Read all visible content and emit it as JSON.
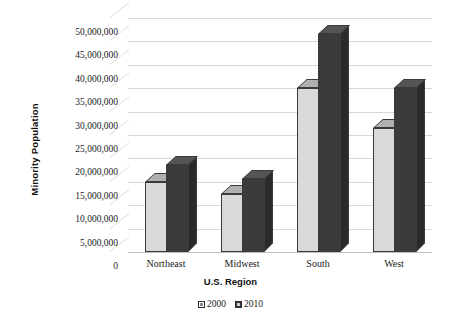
{
  "chart_data": {
    "type": "bar",
    "title": "",
    "xlabel": "U.S. Region",
    "ylabel": "Minority Population",
    "categories": [
      "Northeast",
      "Midwest",
      "South",
      "West"
    ],
    "series": [
      {
        "name": "2000",
        "values": [
          15000000,
          12500000,
          35000000,
          26500000
        ]
      },
      {
        "name": "2010",
        "values": [
          18500000,
          15500000,
          46500000,
          35000000
        ]
      }
    ],
    "ylim": [
      0,
      50000000
    ],
    "ytick_step": 5000000,
    "ytick_labels": [
      "50,000,000",
      "45,000,000",
      "40,000,000",
      "35,000,000",
      "30,000,000",
      "25,000,000",
      "20,000,000",
      "15,000,000",
      "10,000,000",
      "5,000,000",
      "0"
    ],
    "grid": true,
    "legend_position": "bottom",
    "style": "3d-clustered-column",
    "colors": {
      "series_2000": "#d9d9d9",
      "series_2010": "#3b3b3b",
      "gridline": "#d8d8d8",
      "background": "#ffffff"
    }
  }
}
